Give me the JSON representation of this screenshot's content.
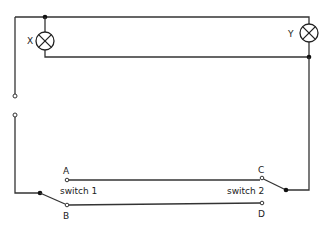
{
  "colors": {
    "wire": "#333333",
    "background": "#ffffff",
    "node": "#111111"
  },
  "lamps": [
    {
      "id": "X",
      "label": "X"
    },
    {
      "id": "Y",
      "label": "Y"
    }
  ],
  "switches": [
    {
      "id": "switch1",
      "label": "switch 1",
      "terminals": [
        "A",
        "B"
      ],
      "connected_to": "B"
    },
    {
      "id": "switch2",
      "label": "switch 2",
      "terminals": [
        "C",
        "D"
      ],
      "connected_to": "C"
    }
  ],
  "terminal_labels": {
    "A": "A",
    "B": "B",
    "C": "C",
    "D": "D"
  }
}
